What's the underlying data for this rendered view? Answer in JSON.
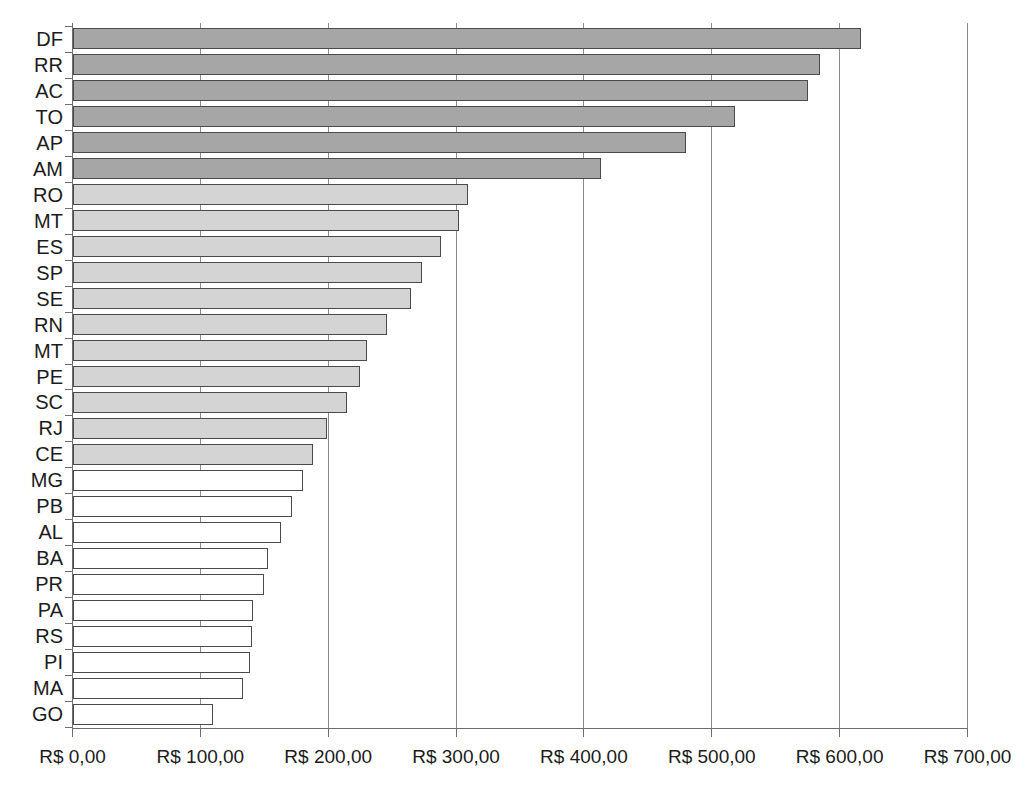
{
  "chart_data": {
    "type": "bar",
    "orientation": "horizontal",
    "title": "",
    "subtitle": "",
    "xlabel": "",
    "ylabel": "",
    "xlim": [
      0,
      700
    ],
    "grid": true,
    "legend": "none",
    "currency_prefix": "R$",
    "decimal_separator": ",",
    "xticks": [
      0,
      100,
      200,
      300,
      400,
      500,
      600,
      700
    ],
    "xtick_labels": [
      "R$ 0,00",
      "R$ 100,00",
      "R$ 200,00",
      "R$ 300,00",
      "R$ 400,00",
      "R$ 500,00",
      "R$ 600,00",
      "R$ 700,00"
    ],
    "categories": [
      "DF",
      "RR",
      "AC",
      "TO",
      "AP",
      "AM",
      "RO",
      "MT",
      "ES",
      "SP",
      "SE",
      "RN",
      "MT",
      "PE",
      "SC",
      "RJ",
      "CE",
      "MG",
      "PB",
      "AL",
      "BA",
      "PR",
      "PA",
      "RS",
      "PI",
      "MA",
      "GO"
    ],
    "values": [
      617,
      585,
      575,
      518,
      480,
      413,
      309,
      302,
      288,
      273,
      265,
      246,
      230,
      225,
      215,
      199,
      188,
      180,
      172,
      163,
      153,
      150,
      141,
      140,
      139,
      133,
      110
    ],
    "bar_groups": [
      "dark",
      "dark",
      "dark",
      "dark",
      "dark",
      "dark",
      "mid",
      "mid",
      "mid",
      "mid",
      "mid",
      "mid",
      "mid",
      "mid",
      "mid",
      "mid",
      "mid",
      "light",
      "light",
      "light",
      "light",
      "light",
      "light",
      "light",
      "light",
      "light",
      "light"
    ],
    "colors": {
      "dark": "#a6a6a6",
      "mid": "#d4d4d4",
      "light": "#ffffff",
      "bar_border": "#4a4a4a",
      "gridline": "#8a8a8a",
      "axis": "#6e6e6e",
      "text": "#1c1c1c",
      "background": "#ffffff"
    }
  }
}
